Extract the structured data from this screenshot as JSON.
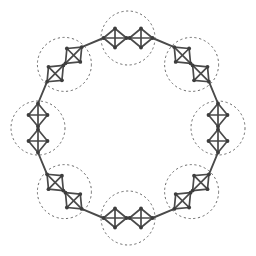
{
  "figure": {
    "type": "graph-diagram",
    "background_color": "#ffffff",
    "width": 256,
    "height": 256
  },
  "style": {
    "edge_color": "#4a4a4a",
    "node_color": "#3d3d3d",
    "circle_color": "#5a5a5a",
    "edge_width": 1.7,
    "link_edge_width": 1.9,
    "node_radius": 1.9,
    "circle_width": 0.9,
    "circle_dash": "2.2 2.6"
  },
  "layout": {
    "center_x": 128,
    "center_y": 128,
    "ring_radius": 90,
    "circle_count": 8,
    "circle_radius": 27,
    "clusters_per_circle": 2,
    "cluster_count": 16,
    "cluster_half_width": 11.5,
    "cluster_half_height": 9.5,
    "cluster_offset_along_ring": 13.0,
    "start_angle_deg": -90
  },
  "cluster": {
    "name": "K4-complete-graph",
    "vertex_count": 4,
    "edge_count": 6,
    "vertices_local": [
      [
        -11.5,
        0
      ],
      [
        0,
        -9.5
      ],
      [
        11.5,
        0
      ],
      [
        0,
        9.5
      ]
    ],
    "edges_local": [
      [
        0,
        1
      ],
      [
        1,
        2
      ],
      [
        2,
        3
      ],
      [
        3,
        0
      ],
      [
        0,
        2
      ],
      [
        1,
        3
      ]
    ]
  },
  "chart_data": {
    "type": "graph",
    "nodes_total": 64,
    "intra_cluster_edges": 96,
    "inter_cluster_edges": 16,
    "circles": [
      {
        "index": 0,
        "angle_deg": -90,
        "cx": 128.0,
        "cy": 38.0,
        "r": 27
      },
      {
        "index": 1,
        "angle_deg": -45,
        "cx": 191.6,
        "cy": 64.4,
        "r": 27
      },
      {
        "index": 2,
        "angle_deg": 0,
        "cx": 218.0,
        "cy": 128.0,
        "r": 27
      },
      {
        "index": 3,
        "angle_deg": 45,
        "cx": 191.6,
        "cy": 191.6,
        "r": 27
      },
      {
        "index": 4,
        "angle_deg": 90,
        "cx": 128.0,
        "cy": 218.0,
        "r": 27
      },
      {
        "index": 5,
        "angle_deg": 135,
        "cx": 64.4,
        "cy": 191.6,
        "r": 27
      },
      {
        "index": 6,
        "angle_deg": 180,
        "cx": 38.0,
        "cy": 128.0,
        "r": 27
      },
      {
        "index": 7,
        "angle_deg": 225,
        "cx": 64.4,
        "cy": 64.4,
        "r": 27
      }
    ],
    "xlim": [
      0,
      256
    ],
    "ylim": [
      0,
      256
    ],
    "grid": false,
    "legend": null,
    "axis_labels": null,
    "tick_labels": null,
    "annotations": []
  }
}
